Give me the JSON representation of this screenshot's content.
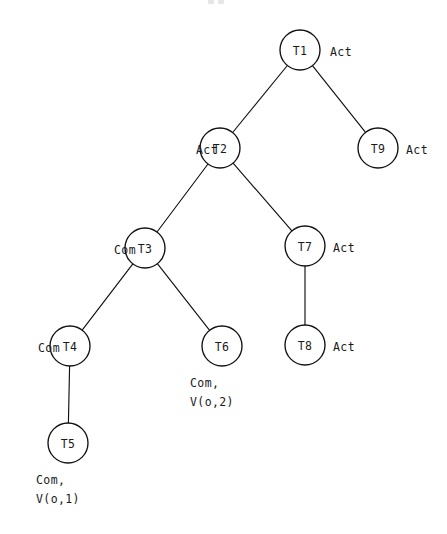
{
  "diagram": {
    "type": "tree",
    "node_radius": 20,
    "stroke_color": "#111111",
    "fill_color": "#ffffff",
    "text_color": "#1a1a1a",
    "nodes": [
      {
        "id": "T1",
        "label": "T1",
        "cx": 300,
        "cy": 50
      },
      {
        "id": "T2",
        "label": "T2",
        "cx": 220,
        "cy": 148
      },
      {
        "id": "T9",
        "label": "T9",
        "cx": 378,
        "cy": 148
      },
      {
        "id": "T3",
        "label": "T3",
        "cx": 145,
        "cy": 248
      },
      {
        "id": "T7",
        "label": "T7",
        "cx": 305,
        "cy": 246
      },
      {
        "id": "T4",
        "label": "T4",
        "cx": 70,
        "cy": 346
      },
      {
        "id": "T6",
        "label": "T6",
        "cx": 222,
        "cy": 346
      },
      {
        "id": "T8",
        "label": "T8",
        "cx": 305,
        "cy": 345
      },
      {
        "id": "T5",
        "label": "T5",
        "cx": 68,
        "cy": 443
      }
    ],
    "edges": [
      {
        "from": "T1",
        "to": "T2"
      },
      {
        "from": "T1",
        "to": "T9"
      },
      {
        "from": "T2",
        "to": "T3"
      },
      {
        "from": "T2",
        "to": "T7"
      },
      {
        "from": "T3",
        "to": "T4"
      },
      {
        "from": "T3",
        "to": "T6"
      },
      {
        "from": "T7",
        "to": "T8"
      },
      {
        "from": "T4",
        "to": "T5"
      }
    ],
    "side_labels": [
      {
        "for": "T1",
        "text": "Act",
        "side": "right",
        "x": 330,
        "y": 43
      },
      {
        "for": "T2",
        "text": "Act",
        "side": "left",
        "x": 148,
        "y": 141
      },
      {
        "for": "T9",
        "text": "Act",
        "side": "right",
        "x": 406,
        "y": 141
      },
      {
        "for": "T3",
        "text": "Com",
        "side": "left",
        "x": 66,
        "y": 241
      },
      {
        "for": "T7",
        "text": "Act",
        "side": "right",
        "x": 333,
        "y": 239
      },
      {
        "for": "T4",
        "text": "Com",
        "side": "left",
        "x": -10,
        "y": 339
      },
      {
        "for": "T8",
        "text": "Act",
        "side": "right",
        "x": 333,
        "y": 338
      }
    ],
    "below_labels": [
      {
        "for": "T6",
        "line1": "Com,",
        "line2": "V(o,2)",
        "x": 190,
        "y": 374
      },
      {
        "for": "T5",
        "line1": "Com,",
        "line2": "V(o,1)",
        "x": 36,
        "y": 471
      }
    ]
  }
}
